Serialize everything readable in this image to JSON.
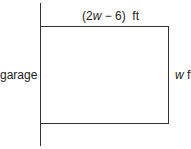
{
  "diagram": {
    "top_label": {
      "prefix": "(2",
      "var": "w",
      "suffix": " − 6)  ft"
    },
    "left_label": "garage",
    "right_label": {
      "var": "w",
      "suffix": " ft"
    },
    "colors": {
      "stroke": "#333333",
      "text": "#222222",
      "background": "#ffffff"
    }
  }
}
